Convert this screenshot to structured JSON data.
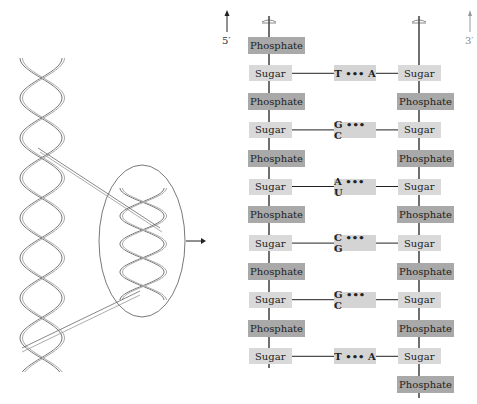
{
  "figure": {
    "left_strand_label": "5′",
    "right_strand_label": "3′",
    "phosphate_label": "Phosphate",
    "sugar_label": "Sugar"
  },
  "left_column": [
    "Phosphate",
    "Sugar",
    "Phosphate",
    "Sugar",
    "Phosphate",
    "Sugar",
    "Phosphate",
    "Sugar",
    "Phosphate",
    "Sugar",
    "Phosphate",
    "Sugar"
  ],
  "right_column": [
    "Sugar",
    "Phosphate",
    "Sugar",
    "Phosphate",
    "Sugar",
    "Phosphate",
    "Sugar",
    "Phosphate",
    "Sugar",
    "Phosphate",
    "Sugar",
    "Phosphate"
  ],
  "base_pairs": [
    {
      "label": "T ••• A"
    },
    {
      "label": "G ••• C"
    },
    {
      "label": "A ••• U"
    },
    {
      "label": "C ••• G"
    },
    {
      "label": "G ••• C"
    },
    {
      "label": "T ••• A"
    }
  ],
  "colors": {
    "phosphate": "#a9a9a9",
    "sugar": "#d9d9d9",
    "pair": "#d4d4d4",
    "line": "#222222"
  }
}
